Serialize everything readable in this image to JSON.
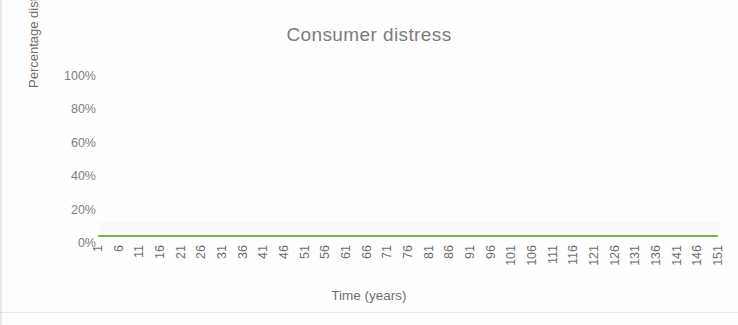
{
  "chart_data": {
    "type": "line",
    "title": "Consumer distress",
    "xlabel": "Time (years)",
    "ylabel": "Percentage distress",
    "grid": false,
    "legend": false,
    "legend_position": "none",
    "xlim": [
      1,
      151
    ],
    "ylim": [
      0,
      100
    ],
    "ytick_labels": [
      "100%",
      "80%",
      "60%",
      "40%",
      "20%",
      "0%"
    ],
    "ytick_values": [
      100,
      80,
      60,
      40,
      20,
      0
    ],
    "xtick_labels": [
      "1",
      "6",
      "11",
      "16",
      "21",
      "26",
      "31",
      "36",
      "41",
      "46",
      "51",
      "56",
      "61",
      "66",
      "71",
      "76",
      "81",
      "86",
      "91",
      "96",
      "101",
      "106",
      "111",
      "116",
      "121",
      "126",
      "131",
      "136",
      "141",
      "146",
      "151"
    ],
    "xtick_values": [
      1,
      6,
      11,
      16,
      21,
      26,
      31,
      36,
      41,
      46,
      51,
      56,
      61,
      66,
      71,
      76,
      81,
      86,
      91,
      96,
      101,
      106,
      111,
      116,
      121,
      126,
      131,
      136,
      141,
      146,
      151
    ],
    "series": [
      {
        "name": "Consumer distress",
        "color": "#7fae5c",
        "x": [
          1,
          6,
          11,
          16,
          21,
          26,
          31,
          36,
          41,
          46,
          51,
          56,
          61,
          66,
          71,
          76,
          81,
          86,
          91,
          96,
          101,
          106,
          111,
          116,
          121,
          126,
          131,
          136,
          141,
          146,
          151
        ],
        "values": [
          0,
          0,
          0,
          0,
          0,
          0,
          0,
          0,
          0,
          0,
          0,
          0,
          0,
          0,
          0,
          0,
          0,
          0,
          0,
          0,
          0,
          0,
          0,
          0,
          0,
          0,
          0,
          0,
          0,
          0,
          0
        ]
      }
    ]
  },
  "colors": {
    "series_green": "#7fae5c",
    "title_gray": "#7c7c7c",
    "tick_gray": "#7d7d7d",
    "background": "#ffffff"
  }
}
